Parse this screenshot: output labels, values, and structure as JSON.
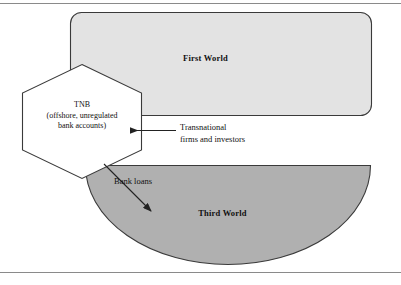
{
  "figure": {
    "kind": "conceptual-diagram",
    "width": 401,
    "height": 285,
    "frame": {
      "top_rule": true,
      "bottom_rule": true,
      "rule_color": "#8a8a8a"
    }
  },
  "shapes": {
    "first_world": {
      "label": "First World",
      "form": "rounded-rectangle",
      "fill": "#e3e3e3",
      "stroke": "#3a3a3a"
    },
    "third_world": {
      "label": "Third World",
      "form": "half-ellipse",
      "fill": "#b0b0b0",
      "stroke": "#3a3a3a"
    },
    "tnb": {
      "form": "hexagon",
      "fill": "#ffffff",
      "stroke": "#3a3a3a",
      "lines": [
        "TNB",
        "(offshore, unregulated",
        "bank accounts)"
      ]
    }
  },
  "annotations": {
    "transnational": {
      "lines": [
        "Transnational",
        "firms and investors"
      ],
      "arrow": "points-left-into-tnb"
    },
    "bank_loans": {
      "label": "Bank loans",
      "arrow": "points-down-right-into-third-world"
    }
  },
  "colors": {
    "arrow": "#222222",
    "text": "#111111",
    "background": "#ffffff"
  }
}
